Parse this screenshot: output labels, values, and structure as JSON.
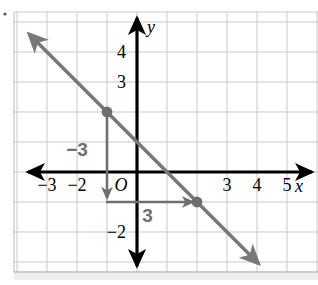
{
  "chart_data": {
    "type": "line",
    "title": "",
    "xlabel": "x",
    "ylabel": "y",
    "xlim": [
      -4,
      6
    ],
    "ylim": [
      -3.3,
      5.3
    ],
    "grid": true,
    "legend": null,
    "x_tick_labels": [
      "−3",
      "−2",
      "3",
      "4",
      "5"
    ],
    "x_tick_values": [
      -3,
      -2,
      3,
      4,
      5
    ],
    "y_tick_labels": [
      "4",
      "3",
      "−2"
    ],
    "y_tick_values": [
      4,
      3,
      -2
    ],
    "origin_label": "O",
    "series": [
      {
        "name": "line",
        "type": "line",
        "color": "#7a7a7a",
        "slope": -1,
        "y_intercept": 1,
        "x": [
          -3.6,
          4.05
        ],
        "y": [
          4.6,
          -3.05
        ],
        "arrows": "both"
      }
    ],
    "points": [
      {
        "label": "",
        "x": -1,
        "y": 2
      },
      {
        "label": "",
        "x": 2,
        "y": -1
      }
    ],
    "annotations": [
      {
        "name": "rise",
        "text": "−3",
        "color": "#6f6f6f",
        "from": {
          "x": -1,
          "y": 2
        },
        "to": {
          "x": -1,
          "y": -1
        },
        "label_x": -2.0,
        "label_y": 0.55
      },
      {
        "name": "run",
        "text": "3",
        "color": "#6f6f6f",
        "from": {
          "x": -1,
          "y": -1
        },
        "to": {
          "x": 2,
          "y": -1
        },
        "label_x": 0.35,
        "label_y": -1.65
      }
    ]
  },
  "figure": {
    "grid_color": "#c9c9c9",
    "axis_color": "#000000",
    "line_color": "#787878",
    "point_color": "#6e6e6e",
    "annotation_color": "#6f6f6f",
    "background": "#ffffff",
    "axis_label_x": "x",
    "axis_label_y": "y"
  }
}
